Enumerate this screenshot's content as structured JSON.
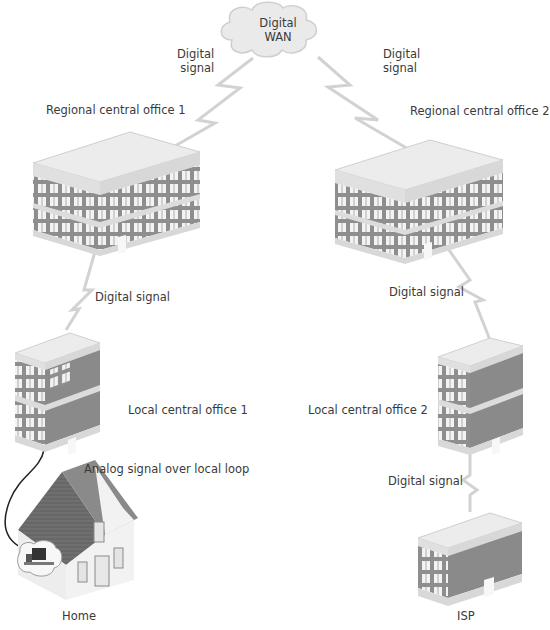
{
  "diagram": {
    "cloud": {
      "line1": "Digital",
      "line2": "WAN"
    },
    "nodes": {
      "regional1": {
        "label": "Regional central office 1"
      },
      "regional2": {
        "label": "Regional central office 2"
      },
      "local1": {
        "label": "Local central office 1"
      },
      "local2": {
        "label": "Local central office 2"
      },
      "home": {
        "label": "Home"
      },
      "isp": {
        "label": "ISP"
      }
    },
    "links": {
      "wan_to_regional1": {
        "line1": "Digital",
        "line2": "signal"
      },
      "wan_to_regional2": {
        "line1": "Digital",
        "line2": "signal"
      },
      "regional1_to_local1": {
        "label": "Digital signal"
      },
      "regional2_to_local2": {
        "label": "Digital signal"
      },
      "local2_to_isp": {
        "label": "Digital signal"
      },
      "local1_to_home": {
        "label": "Analog signal over local loop"
      }
    },
    "colors": {
      "link": "#cfcfcf",
      "wall": "#8a8a8a",
      "roof": "#e6e6e6",
      "window": "#f4f4f4",
      "analog_wire": "#222222",
      "house_roof": "#6e6e6e"
    }
  }
}
